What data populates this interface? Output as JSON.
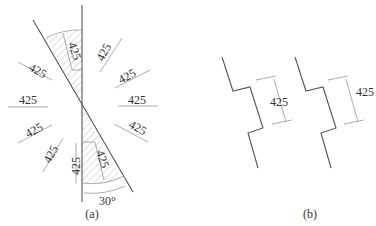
{
  "figure": {
    "panel_a": {
      "caption": "(a)",
      "angle_label": "30°",
      "dimension_labels": [
        "425",
        "425",
        "425",
        "425",
        "425",
        "425",
        "425",
        "425",
        "425",
        "425",
        "425",
        "425"
      ]
    },
    "panel_b": {
      "caption": "(b)",
      "dimension_labels": [
        "425",
        "425"
      ]
    }
  },
  "colors": {
    "line": "#555555",
    "hatch": "#999999",
    "text": "#333333",
    "background": "#ffffff"
  }
}
